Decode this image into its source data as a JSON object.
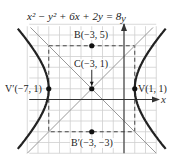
{
  "title": "x² − y² + 6x + 2y = 8",
  "axes": {
    "x_label": "x",
    "y_label": "y"
  },
  "points": {
    "B": {
      "label": "B(−3, 5)",
      "x": -3,
      "y": 5
    },
    "C": {
      "label": "C(−3, 1)",
      "x": -3,
      "y": 1
    },
    "V": {
      "label": "V(1, 1)",
      "x": 1,
      "y": 1
    },
    "Vprime": {
      "label": "V′(−7, 1)",
      "x": -7,
      "y": 1
    },
    "Bprime": {
      "label": "B′(−3, −3)",
      "x": -3,
      "y": -3
    }
  },
  "chart_data": {
    "type": "scatter",
    "title": "x² − y² + 6x + 2y = 8",
    "xlabel": "x",
    "ylabel": "y",
    "xlim": [
      -9,
      3
    ],
    "ylim": [
      -5,
      7
    ],
    "grid": true,
    "curve": "hyperbola (x+3)²/16 − (y−1)²/16 = 1",
    "asymptotes": [
      "y − 1 = x + 3",
      "y − 1 = −(x + 3)"
    ],
    "points": [
      {
        "name": "B",
        "x": -3,
        "y": 5
      },
      {
        "name": "C",
        "x": -3,
        "y": 1
      },
      {
        "name": "V",
        "x": 1,
        "y": 1
      },
      {
        "name": "V′",
        "x": -7,
        "y": 1
      },
      {
        "name": "B′",
        "x": -3,
        "y": -3
      }
    ],
    "fundamental_rectangle": {
      "x": [
        -7,
        1
      ],
      "y": [
        -3,
        5
      ]
    }
  }
}
